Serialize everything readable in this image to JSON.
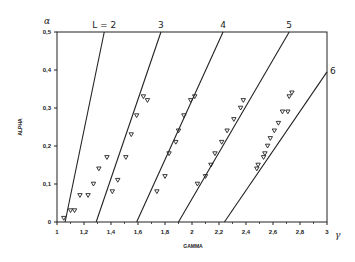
{
  "chart_data": {
    "type": "scatter",
    "title": "",
    "xlabel": "GAMMA",
    "ylabel": "ALPHA",
    "x_symbol": "γ",
    "y_symbol": "α",
    "xlim": [
      1,
      3
    ],
    "ylim": [
      0,
      0.5
    ],
    "grid": false,
    "legend": "none",
    "x_ticks": [
      "1",
      "1,2",
      "1,4",
      "1,6",
      "1,8",
      "2",
      "2,2",
      "2,4",
      "2,6",
      "2,8",
      "3"
    ],
    "y_ticks": [
      "0",
      "0,1",
      "0,2",
      "0,3",
      "0,4",
      "0,5"
    ],
    "lines": [
      {
        "name": "L = 2",
        "label": "L = 2",
        "x": [
          1.06,
          1.35
        ],
        "y": [
          0,
          0.5
        ]
      },
      {
        "name": "L = 3",
        "label": "3",
        "x": [
          1.29,
          1.77
        ],
        "y": [
          0,
          0.5
        ]
      },
      {
        "name": "L = 4",
        "label": "4",
        "x": [
          1.59,
          2.23
        ],
        "y": [
          0,
          0.5
        ]
      },
      {
        "name": "L = 5",
        "label": "5",
        "x": [
          1.9,
          2.72
        ],
        "y": [
          0,
          0.5
        ]
      },
      {
        "name": "L = 6",
        "label": "6",
        "x": [
          2.24,
          3.0
        ],
        "y": [
          0,
          0.395
        ]
      }
    ],
    "series": [
      {
        "name": "L=2 data",
        "marker": "triangle-down",
        "x": [
          1.05,
          1.1,
          1.13,
          1.17,
          1.23,
          1.27,
          1.31,
          1.37
        ],
        "y": [
          0.01,
          0.03,
          0.03,
          0.07,
          0.07,
          0.1,
          0.14,
          0.17
        ]
      },
      {
        "name": "L=3 data",
        "marker": "triangle-down",
        "x": [
          1.41,
          1.45,
          1.51,
          1.55,
          1.59,
          1.64,
          1.67
        ],
        "y": [
          0.08,
          0.11,
          0.17,
          0.23,
          0.28,
          0.33,
          0.32
        ]
      },
      {
        "name": "L=4 data",
        "marker": "triangle-down",
        "x": [
          1.74,
          1.8,
          1.83,
          1.88,
          1.9,
          1.94,
          1.99,
          2.02
        ],
        "y": [
          0.08,
          0.12,
          0.18,
          0.21,
          0.24,
          0.28,
          0.32,
          0.33
        ]
      },
      {
        "name": "L=5 data",
        "marker": "triangle-down",
        "x": [
          2.04,
          2.1,
          2.14,
          2.17,
          2.22,
          2.26,
          2.31,
          2.36,
          2.38
        ],
        "y": [
          0.1,
          0.12,
          0.15,
          0.18,
          0.21,
          0.24,
          0.27,
          0.3,
          0.32
        ]
      },
      {
        "name": "L=6 data",
        "marker": "triangle-down",
        "x": [
          2.48,
          2.49,
          2.53,
          2.54,
          2.56,
          2.58,
          2.61,
          2.64,
          2.67,
          2.71,
          2.72,
          2.74
        ],
        "y": [
          0.14,
          0.15,
          0.17,
          0.18,
          0.2,
          0.22,
          0.24,
          0.26,
          0.29,
          0.29,
          0.33,
          0.34
        ]
      }
    ]
  }
}
